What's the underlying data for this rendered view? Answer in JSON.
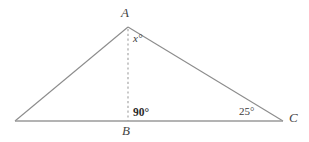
{
  "figure": {
    "type": "triangle-with-altitude",
    "stroke_color": "#8c8c8c",
    "baseline_color": "#9a9a9a",
    "dash_color": "#9e9e9e",
    "background": "#ffffff"
  },
  "vertices": {
    "apex": {
      "label": "A",
      "x": 128,
      "y": 27
    },
    "left": {
      "label": "",
      "x": 15,
      "y": 121
    },
    "foot": {
      "label": "B",
      "x": 128,
      "y": 121
    },
    "right": {
      "label": "C",
      "x": 283,
      "y": 121
    }
  },
  "angles": {
    "apex_partial": {
      "label": "x°",
      "value": "x",
      "unit": "degrees",
      "bold": false
    },
    "foot": {
      "label": "90°",
      "value": "90",
      "unit": "degrees",
      "bold": true
    },
    "right": {
      "label": "25°",
      "value": "25",
      "unit": "degrees",
      "bold": false
    }
  },
  "segments": {
    "left_side": "from left vertex to A",
    "right_side": "from A to C",
    "base": "from left vertex to C",
    "altitude": "dashed from A to B"
  }
}
